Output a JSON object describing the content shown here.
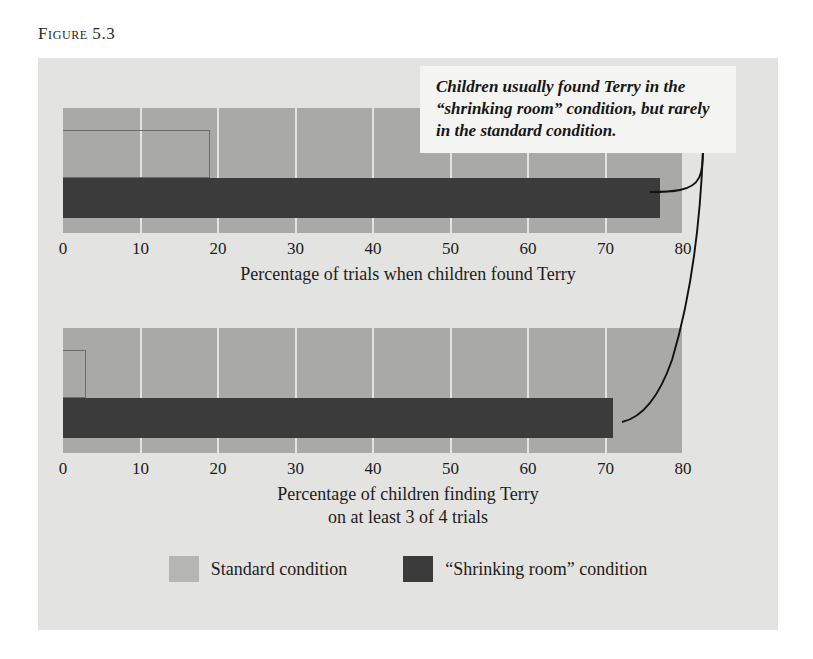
{
  "figure": {
    "label_word": "Figure",
    "label_number": "5.3"
  },
  "callout": {
    "text": "Children usually found Terry in the “shrinking room” condition, but rarely in the standard condition."
  },
  "legend": {
    "items": [
      {
        "label": "Standard condition",
        "color": "#b5b5b3",
        "key": "standard"
      },
      {
        "label": "“Shrinking room” condition",
        "color": "#3b3b3b",
        "key": "shrinking"
      }
    ]
  },
  "colors": {
    "card_background": "#e3e3e1",
    "plot_background": "#a9a9a7",
    "gridline": "#e3e3e1",
    "bar_dark": "#3b3b3b",
    "bar_light_outline": "#6d6d6b",
    "text": "#1c1c1c",
    "callout_background": "#f4f4f2"
  },
  "chart_data": [
    {
      "type": "bar",
      "orientation": "horizontal",
      "title": "",
      "xlabel": "Percentage of trials when children found Terry",
      "ylabel": "",
      "xlim": [
        0,
        80
      ],
      "ticks": [
        "0",
        "10",
        "20",
        "30",
        "40",
        "50",
        "60",
        "70",
        "80"
      ],
      "tick_values": [
        0,
        10,
        20,
        30,
        40,
        50,
        60,
        70,
        80
      ],
      "grid": true,
      "legend_position": "bottom",
      "categories": [
        "Standard condition",
        "“Shrinking room” condition"
      ],
      "series": [
        {
          "name": "Standard condition",
          "values": [
            19
          ]
        },
        {
          "name": "“Shrinking room” condition",
          "values": [
            77
          ]
        }
      ]
    },
    {
      "type": "bar",
      "orientation": "horizontal",
      "title": "",
      "xlabel_line1": "Percentage of children finding Terry",
      "xlabel_line2": "on at least 3 of 4 trials",
      "ylabel": "",
      "xlim": [
        0,
        80
      ],
      "ticks": [
        "0",
        "10",
        "20",
        "30",
        "40",
        "50",
        "60",
        "70",
        "80"
      ],
      "tick_values": [
        0,
        10,
        20,
        30,
        40,
        50,
        60,
        70,
        80
      ],
      "grid": true,
      "legend_position": "bottom",
      "categories": [
        "Standard condition",
        "“Shrinking room” condition"
      ],
      "series": [
        {
          "name": "Standard condition",
          "values": [
            3
          ]
        },
        {
          "name": "“Shrinking room” condition",
          "values": [
            71
          ]
        }
      ]
    }
  ]
}
